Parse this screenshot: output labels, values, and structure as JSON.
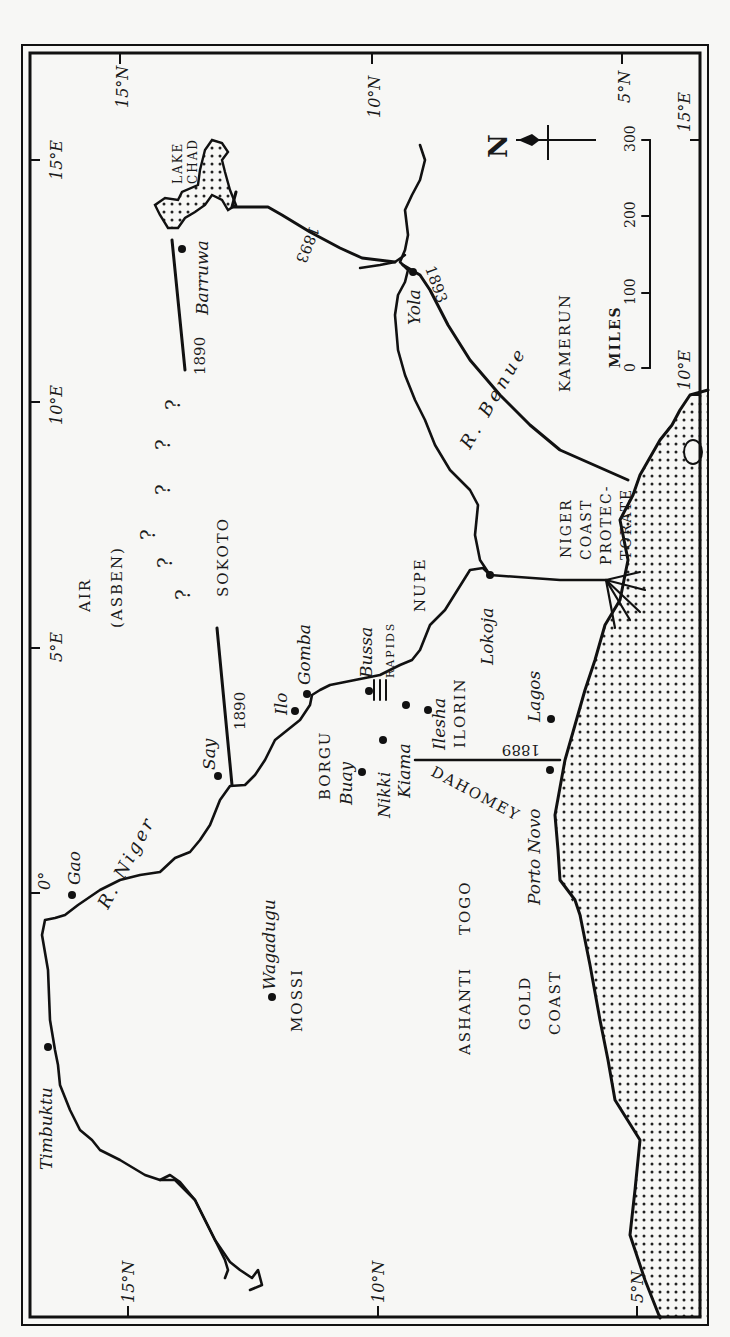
{
  "map": {
    "title": "Niger region c. 1889–1893 (rotated map)",
    "colors": {
      "ink": "#111111",
      "paper": "#f7f7f5",
      "sea_dots": "#222222"
    },
    "graticule": {
      "top": [
        "15°N",
        "10°N",
        "5°N"
      ],
      "bottom": [
        "15°N",
        "10°N",
        "5°N"
      ],
      "left": [
        "15°E",
        "10°E",
        "5°E",
        "0°"
      ],
      "right": [
        "15°E",
        "10°E"
      ]
    },
    "regions": {
      "air": "AIR",
      "asben": "(ASBEN)",
      "sokoto": "SOKOTO",
      "nupe": "NUPE",
      "borgu": "BORGU",
      "ilorin": "ILORIN",
      "mossi": "MOSSI",
      "ashanti": "ASHANTI",
      "togo": "TOGO",
      "dahomey": "DAHOMEY",
      "gold": "GOLD",
      "coast": "COAST",
      "kamerun": "KAMERUN",
      "niger_coast": [
        "NIGER",
        "COAST",
        "PROTEC-",
        "TORATE"
      ],
      "lake_chad": [
        "LAKE",
        "CHAD"
      ]
    },
    "places": {
      "timbuktu": "Timbuktu",
      "gao": "Gao",
      "say": "Say",
      "ilo": "Ilo",
      "gomba": "Gomba",
      "bussa": "Bussa",
      "rapids": "RAPIDS",
      "buay": "Buay",
      "nikki": "Nikki",
      "kiama": "Kiama",
      "ilesha": "Ilesha",
      "lokoja": "Lokoja",
      "lagos": "Lagos",
      "porto_novo": "Porto Novo",
      "wagadugu": "Wagadugu",
      "yola": "Yola",
      "barruwa": "Barruwa"
    },
    "rivers": {
      "niger": "R. Niger",
      "benue": "R. Benue"
    },
    "boundaries": {
      "b1890a": "1890",
      "b1890b": "1890",
      "b1889": "1889",
      "b1893a": "1893",
      "b1893b": "1893"
    },
    "unknown_marks": [
      "?",
      "?",
      "?",
      "?",
      "?",
      "?",
      "?"
    ],
    "compass": {
      "label": "N"
    },
    "scale": {
      "unit": "MILES",
      "ticks": [
        "0",
        "100",
        "200",
        "300"
      ]
    }
  }
}
